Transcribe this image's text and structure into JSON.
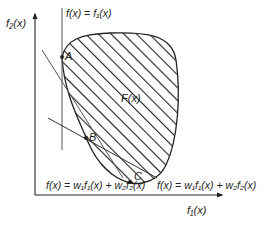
{
  "diagram": {
    "type": "objective-space-weighted-sum",
    "axes": {
      "x_label": "f₁(x)",
      "y_label": "f₂(x)"
    },
    "vertical_line_label": "f(x) = f₁(x)",
    "region_label": "F(x)",
    "points": [
      {
        "id": "A",
        "label": "A"
      },
      {
        "id": "B",
        "label": "B"
      },
      {
        "id": "C",
        "label": "C"
      }
    ],
    "lines": [
      {
        "id": "steep",
        "label": "f(x) = w₁f₁(x) + w₂f₂(x)"
      },
      {
        "id": "shallow",
        "label": "f(x) = w₁f₁(x) + w₂f₂(x)"
      }
    ],
    "colors": {
      "stroke": "#222222",
      "line": "#555555",
      "background": "#ffffff"
    }
  }
}
